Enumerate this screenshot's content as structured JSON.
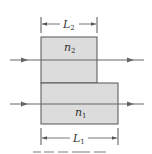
{
  "figure": {
    "dimension_top": {
      "symbol": "L",
      "subscript": "2"
    },
    "dimension_bottom": {
      "symbol": "L",
      "subscript": "1"
    },
    "region_top": {
      "symbol": "n",
      "subscript": "2"
    },
    "region_bottom": {
      "symbol": "n",
      "subscript": "1"
    },
    "rays": [
      {
        "name": "upper-ray",
        "direction": "right"
      },
      {
        "name": "lower-ray",
        "direction": "right"
      }
    ],
    "colors": {
      "fill": "#dcdcdc",
      "stroke": "#555555",
      "ray": "#666666",
      "text": "#333333"
    }
  }
}
